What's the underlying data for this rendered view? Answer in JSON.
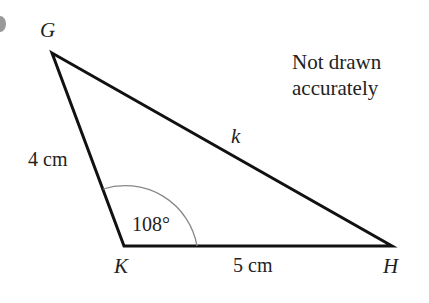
{
  "diagram": {
    "type": "triangle",
    "vertices": {
      "G": {
        "label": "G",
        "x": 52,
        "y": 53
      },
      "K": {
        "label": "K",
        "x": 124,
        "y": 246
      },
      "H": {
        "label": "H",
        "x": 392,
        "y": 246
      }
    },
    "sides": {
      "GK": {
        "label": "4 cm"
      },
      "KH": {
        "label": "5 cm"
      },
      "GH": {
        "label": "k"
      }
    },
    "angle_K": {
      "label": "108°"
    },
    "note": {
      "line1": "Not drawn",
      "line2": "accurately"
    },
    "colors": {
      "stroke": "#111111",
      "arc": "#888888",
      "text": "#222222"
    }
  }
}
